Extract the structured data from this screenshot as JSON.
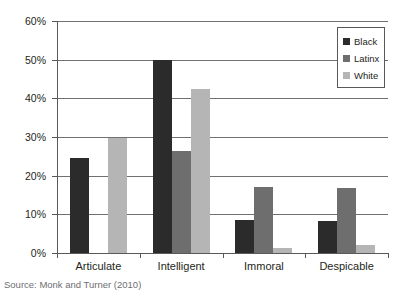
{
  "chart_data": {
    "type": "bar",
    "title": "",
    "subtitle": "",
    "xlabel": "",
    "ylabel": "",
    "categories": [
      "Articulate",
      "Intelligent",
      "Immoral",
      "Despicable"
    ],
    "series": [
      {
        "name": "Black",
        "color": "#2b2b2b",
        "values": [
          24.7,
          49.8,
          8.6,
          8.2
        ]
      },
      {
        "name": "Latinx",
        "color": "#6e6e6e",
        "values": [
          0,
          26.5,
          17.0,
          16.8
        ]
      },
      {
        "name": "White",
        "color": "#b5b5b5",
        "values": [
          29.7,
          42.5,
          1.3,
          2.0
        ]
      }
    ],
    "ylim": [
      0,
      60
    ],
    "yticks": [
      0,
      10,
      20,
      30,
      40,
      50,
      60
    ],
    "ytick_labels": [
      "0%",
      "10%",
      "20%",
      "30%",
      "40%",
      "50%",
      "60%"
    ],
    "grid": true,
    "grid_axis": "y",
    "legend_position": "top-right",
    "annotations": []
  },
  "legend": {
    "entries": [
      {
        "label": "Black",
        "swatch": "legend-swatch-black"
      },
      {
        "label": "Latinx",
        "swatch": "legend-swatch-latinx"
      },
      {
        "label": "White",
        "swatch": "legend-swatch-white"
      }
    ]
  },
  "footer": {
    "source": "Source: Monk and Turner (2010)"
  },
  "colors": {
    "black_series": "#2b2b2b",
    "latinx_series": "#6e6e6e",
    "white_series": "#b5b5b5",
    "axis": "#58595b",
    "grid": "#6f7072",
    "text": "#231f20",
    "source_text": "#6d6e71",
    "background": "#ffffff"
  }
}
